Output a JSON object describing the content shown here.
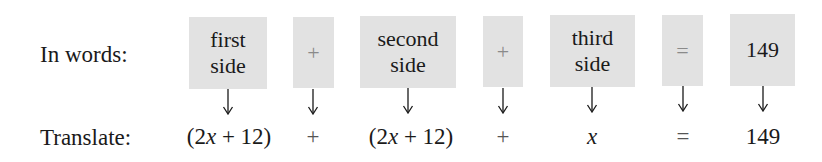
{
  "rows": {
    "words_label": "In words:",
    "translate_label": "Translate:"
  },
  "words": [
    {
      "id": "first-side",
      "line1": "first",
      "line2": "side",
      "type": "term"
    },
    {
      "id": "plus-1",
      "line1": "+",
      "line2": "",
      "type": "operator"
    },
    {
      "id": "second-side",
      "line1": "second",
      "line2": "side",
      "type": "term"
    },
    {
      "id": "plus-2",
      "line1": "+",
      "line2": "",
      "type": "operator"
    },
    {
      "id": "third-side",
      "line1": "third",
      "line2": "side",
      "type": "term"
    },
    {
      "id": "equals",
      "line1": "=",
      "line2": "",
      "type": "operator"
    },
    {
      "id": "total",
      "line1": "149",
      "line2": "",
      "type": "term"
    }
  ],
  "translate": [
    {
      "id": "first-side-expr",
      "pre": "(2",
      "var": "x",
      "post": " + 12)"
    },
    {
      "id": "plus-1",
      "pre": "+",
      "var": "",
      "post": ""
    },
    {
      "id": "second-side-expr",
      "pre": "(2",
      "var": "x",
      "post": " + 12)"
    },
    {
      "id": "plus-2",
      "pre": "+",
      "var": "",
      "post": ""
    },
    {
      "id": "third-side-expr",
      "pre": "",
      "var": "x",
      "post": ""
    },
    {
      "id": "equals",
      "pre": "=",
      "var": "",
      "post": ""
    },
    {
      "id": "total",
      "pre": "149",
      "var": "",
      "post": ""
    }
  ],
  "colors": {
    "box_fill": "#e2e2e2",
    "operator_in_box": "#8a8a8a",
    "text": "#1a1a1a"
  }
}
